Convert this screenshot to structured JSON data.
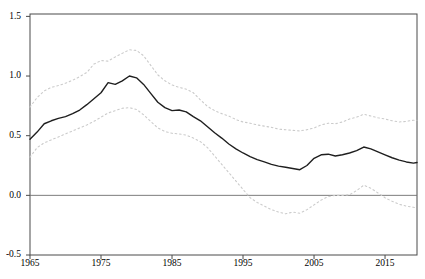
{
  "chart_data": {
    "type": "line",
    "title": "",
    "xlabel": "",
    "ylabel": "",
    "xlim": [
      1965,
      2019.5
    ],
    "ylim": [
      -0.5,
      1.52
    ],
    "grid": false,
    "legend": null,
    "zero_line": 0,
    "xticks": [
      1965,
      1975,
      1985,
      1995,
      2005,
      2015
    ],
    "xtick_labels": [
      "1965",
      "1975",
      "1985",
      "1995",
      "2005",
      "2015"
    ],
    "yticks": [
      1.5,
      1.0,
      0.5,
      0.0,
      -0.5
    ],
    "ytick_labels": [
      "1.5",
      "1.0",
      "0.5",
      "0.0",
      "-0.5"
    ],
    "x": [
      1965,
      1966,
      1967,
      1968,
      1969,
      1970,
      1971,
      1972,
      1973,
      1974,
      1975,
      1976,
      1977,
      1978,
      1979,
      1980,
      1981,
      1982,
      1983,
      1984,
      1985,
      1986,
      1987,
      1988,
      1989,
      1990,
      1991,
      1992,
      1993,
      1994,
      1995,
      1996,
      1997,
      1998,
      1999,
      2000,
      2001,
      2002,
      2003,
      2004,
      2005,
      2006,
      2007,
      2008,
      2009,
      2010,
      2011,
      2012,
      2013,
      2014,
      2015,
      2016,
      2017,
      2018,
      2019,
      2019.5
    ],
    "series": [
      {
        "name": "point-estimate",
        "style": "solid",
        "color": "#1f1f1f",
        "width": 1.4,
        "values": [
          0.47,
          0.53,
          0.6,
          0.625,
          0.645,
          0.66,
          0.685,
          0.715,
          0.76,
          0.81,
          0.86,
          0.945,
          0.93,
          0.96,
          1.0,
          0.985,
          0.93,
          0.855,
          0.78,
          0.735,
          0.71,
          0.715,
          0.7,
          0.66,
          0.625,
          0.575,
          0.525,
          0.48,
          0.43,
          0.39,
          0.355,
          0.325,
          0.3,
          0.28,
          0.26,
          0.245,
          0.235,
          0.225,
          0.215,
          0.25,
          0.31,
          0.34,
          0.345,
          0.33,
          0.34,
          0.355,
          0.375,
          0.405,
          0.39,
          0.365,
          0.34,
          0.315,
          0.295,
          0.28,
          0.27,
          0.275
        ]
      },
      {
        "name": "upper-confidence-band",
        "style": "dotted",
        "color": "#cbcbcb",
        "width": 1.1,
        "values": [
          0.74,
          0.82,
          0.875,
          0.905,
          0.92,
          0.94,
          0.965,
          0.995,
          1.03,
          1.1,
          1.13,
          1.125,
          1.16,
          1.19,
          1.22,
          1.215,
          1.17,
          1.09,
          1.01,
          0.96,
          0.925,
          0.905,
          0.89,
          0.86,
          0.8,
          0.745,
          0.71,
          0.685,
          0.665,
          0.635,
          0.615,
          0.605,
          0.59,
          0.58,
          0.57,
          0.555,
          0.55,
          0.545,
          0.54,
          0.55,
          0.565,
          0.59,
          0.605,
          0.6,
          0.615,
          0.64,
          0.655,
          0.68,
          0.665,
          0.65,
          0.64,
          0.625,
          0.615,
          0.62,
          0.63,
          0.63
        ]
      },
      {
        "name": "lower-confidence-band",
        "style": "dotted",
        "color": "#cbcbcb",
        "width": 1.1,
        "values": [
          0.32,
          0.4,
          0.44,
          0.465,
          0.49,
          0.515,
          0.54,
          0.565,
          0.59,
          0.62,
          0.655,
          0.69,
          0.71,
          0.73,
          0.735,
          0.72,
          0.675,
          0.62,
          0.565,
          0.535,
          0.52,
          0.515,
          0.505,
          0.48,
          0.45,
          0.4,
          0.33,
          0.26,
          0.19,
          0.12,
          0.05,
          -0.02,
          -0.06,
          -0.09,
          -0.12,
          -0.14,
          -0.155,
          -0.14,
          -0.15,
          -0.12,
          -0.08,
          -0.04,
          -0.01,
          0.0,
          0.0,
          0.005,
          0.04,
          0.085,
          0.06,
          0.02,
          -0.02,
          -0.05,
          -0.075,
          -0.09,
          -0.1,
          -0.105
        ]
      }
    ]
  },
  "frame": {
    "background": "#ffffff",
    "frame_color": "#4a4a4a",
    "zero_line_color": "#6e6e6e",
    "tick_color": "#4a4a4a",
    "tick_label_color": "#000000"
  }
}
